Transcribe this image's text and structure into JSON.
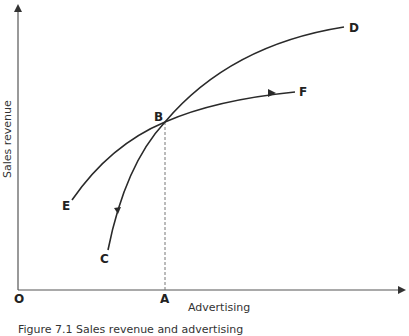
{
  "diagram": {
    "x_axis_label": "Advertising",
    "y_axis_label": "Sales revenue",
    "origin_label": "O",
    "point_labels": {
      "A": "A",
      "B": "B",
      "C": "C",
      "D": "D",
      "E": "E",
      "F": "F"
    },
    "curves": [
      {
        "name": "CD",
        "from": "C",
        "to": "D",
        "through": "B",
        "arrow_direction": "toward C"
      },
      {
        "name": "EF",
        "from": "E",
        "to": "F",
        "through": "B",
        "arrow_direction": "toward F"
      }
    ],
    "guides": [
      {
        "from": "B",
        "to": "A",
        "style": "dashed vertical"
      }
    ]
  },
  "caption": "Figure 7.1 Sales revenue and advertising"
}
